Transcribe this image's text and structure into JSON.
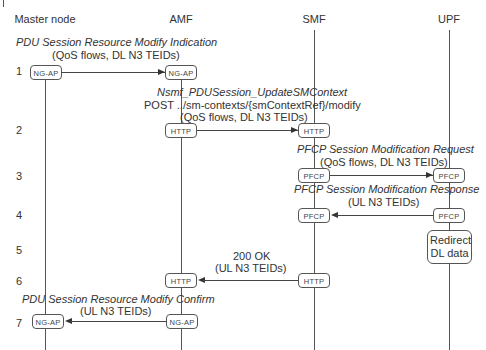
{
  "diagram": {
    "type": "sequence",
    "participants": [
      {
        "id": "master",
        "label": "Master node"
      },
      {
        "id": "amf",
        "label": "AMF"
      },
      {
        "id": "smf",
        "label": "SMF"
      },
      {
        "id": "upf",
        "label": "UPF"
      }
    ],
    "steps": [
      {
        "num": "1",
        "from": "master",
        "to": "amf",
        "protocol_from": "NG-AP",
        "protocol_to": "NG-AP",
        "title": "PDU Session Resource Modify Indication",
        "params": "(QoS flows, DL N3 TEIDs)"
      },
      {
        "num": "2",
        "from": "amf",
        "to": "smf",
        "protocol_from": "HTTP",
        "protocol_to": "HTTP",
        "title": "Nsmf_PDUSession_UpdateSMContext",
        "line2": "POST ../sm-contexts/{smContextRef}/modify",
        "params": "(QoS flows, DL N3 TEIDs)"
      },
      {
        "num": "3",
        "from": "smf",
        "to": "upf",
        "protocol_from": "PFCP",
        "protocol_to": "PFCP",
        "title": "PFCP Session Modification Request",
        "params": "(QoS flows, DL N3 TEIDs)"
      },
      {
        "num": "4",
        "from": "upf",
        "to": "smf",
        "protocol_from": "PFCP",
        "protocol_to": "PFCP",
        "title": "PFCP Session Modification Response",
        "params": "(UL N3 TEIDs)"
      },
      {
        "num": "5",
        "at": "upf",
        "action_line1": "Redirect",
        "action_line2": "DL data"
      },
      {
        "num": "6",
        "from": "smf",
        "to": "amf",
        "protocol_from": "HTTP",
        "protocol_to": "HTTP",
        "title": "200 OK",
        "params": "(UL N3 TEIDs)"
      },
      {
        "num": "7",
        "from": "amf",
        "to": "master",
        "protocol_from": "NG-AP",
        "protocol_to": "NG-AP",
        "title": "PDU Session Resource Modify Confirm",
        "params": "(UL N3 TEIDs)"
      }
    ]
  }
}
